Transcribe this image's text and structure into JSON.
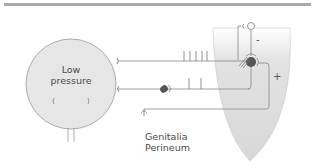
{
  "diagram": {
    "bladder": {
      "label": "Low pressure"
    },
    "peripheral": {
      "label": "Genitalia\nPerineum"
    },
    "signs": {
      "inhibitory": "-",
      "excitatory": "+"
    },
    "colors": {
      "bladder_fill": "#e6e6e6",
      "spinal_cord_fill": "#dedede",
      "line": "#888888",
      "neuron_dark": "#555555",
      "rule": "#a8a8a8"
    },
    "afferent_ticks_upper": 5,
    "afferent_ticks_lower": 2
  }
}
